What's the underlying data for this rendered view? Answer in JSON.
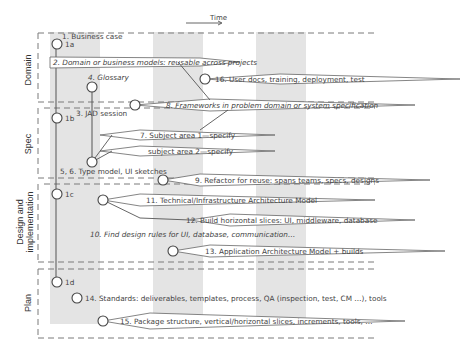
{
  "time_axis": {
    "label": "Time"
  },
  "lanes": [
    {
      "id": "domain",
      "label": "Domain"
    },
    {
      "id": "spec",
      "label": "Spec"
    },
    {
      "id": "design",
      "label_line1": "Design and",
      "label_line2": "implementation"
    },
    {
      "id": "plan",
      "label": "Plan"
    }
  ],
  "milestones": {
    "m1a": "1a",
    "m1b": "1b",
    "m1c": "1c",
    "m1d": "1d"
  },
  "items": {
    "i1": "1. Business case",
    "i2": "2. Domain or business models: reusable across projects",
    "i3": "3. JAD session",
    "i4": "4. Glossary",
    "i56": "5, 6. Type model, UI sketches",
    "i7": "7. Subject area 1—specify",
    "i7b": "subject area 2—specify",
    "i8": "8. Frameworks in problem domain or system specification",
    "i9": "9. Refactor for reuse: spans teams, specs, designs",
    "i10": "10. Find design rules for UI, database, communication…",
    "i11": "11. Technical/Infrastructure Architecture Model",
    "i12": "12. Build horizontal slices: UI, middleware, database",
    "i13": "13. Application Architecture Model + builds",
    "i14": "14. Standards: deliverables, templates, process, QA (inspection, test, CM …), tools",
    "i15": "15. Package structure, vertical/horizontal slices, increments, tools, …",
    "i16": "16. User docs, training, deployment, test"
  },
  "colors": {
    "band": "#e4e4e4",
    "line": "#555555",
    "dash": "#7a7a7a"
  }
}
